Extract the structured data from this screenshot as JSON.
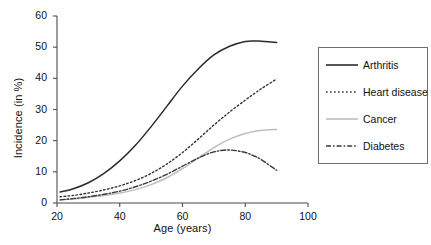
{
  "chart_data": {
    "type": "line",
    "title": "",
    "xlabel": "Age (years)",
    "ylabel": "Incidence (in %)",
    "xlim": [
      20,
      100
    ],
    "ylim": [
      0,
      60
    ],
    "xticks": [
      20,
      40,
      60,
      80,
      100
    ],
    "yticks": [
      0,
      10,
      20,
      30,
      40,
      50,
      60
    ],
    "grid": false,
    "legend_position": "right-outside",
    "x": [
      21,
      25,
      30,
      35,
      40,
      45,
      50,
      55,
      60,
      65,
      70,
      75,
      80,
      83,
      85,
      90
    ],
    "series": [
      {
        "name": "Arthritis",
        "style": "solid",
        "color": "#2b2b2b",
        "values": [
          3.5,
          4.5,
          6.5,
          9.5,
          13.5,
          18.5,
          24.5,
          31.0,
          37.5,
          43.0,
          47.5,
          50.3,
          51.8,
          52.0,
          51.9,
          51.5
        ]
      },
      {
        "name": "Heart disease",
        "style": "dotted",
        "color": "#333333",
        "values": [
          2.0,
          2.4,
          3.2,
          4.2,
          5.5,
          7.2,
          9.5,
          12.5,
          16.2,
          20.5,
          25.0,
          29.2,
          33.0,
          35.2,
          36.6,
          39.8
        ]
      },
      {
        "name": "Cancer",
        "style": "solid",
        "color": "#bdbdbd",
        "values": [
          1.0,
          1.3,
          1.8,
          2.4,
          3.2,
          4.3,
          5.9,
          8.1,
          11.0,
          14.4,
          17.8,
          20.5,
          22.3,
          23.0,
          23.3,
          23.6
        ]
      },
      {
        "name": "Diabetes",
        "style": "dash-dot",
        "color": "#3a3a3a",
        "values": [
          1.0,
          1.4,
          2.0,
          2.8,
          3.8,
          5.2,
          7.0,
          9.2,
          11.8,
          14.4,
          16.4,
          17.0,
          16.2,
          15.0,
          14.0,
          10.5
        ]
      }
    ]
  },
  "axis": {
    "x_tick_labels": [
      "20",
      "40",
      "60",
      "80",
      "100"
    ],
    "y_tick_labels": [
      "0",
      "10",
      "20",
      "30",
      "40",
      "50",
      "60"
    ],
    "x_title": "Age (years)",
    "y_title": "Incidence (in %)"
  },
  "legend": {
    "entries": [
      {
        "label": "Arthritis"
      },
      {
        "label": "Heart disease"
      },
      {
        "label": "Cancer"
      },
      {
        "label": "Diabetes"
      }
    ]
  }
}
